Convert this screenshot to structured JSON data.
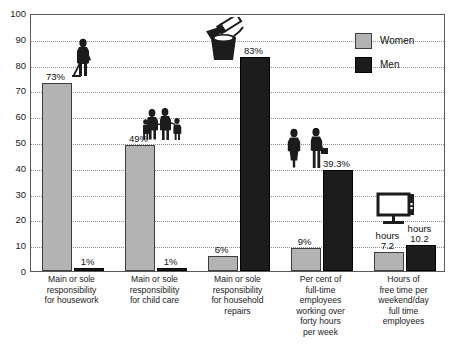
{
  "chart_data": {
    "type": "bar",
    "title": "",
    "subtitle": "",
    "xlabel": "",
    "ylabel": "",
    "ylim": [
      0,
      100
    ],
    "ytick_step": 10,
    "yticks": [
      "100",
      "90",
      "80",
      "70",
      "60",
      "50",
      "40",
      "30",
      "20",
      "10",
      "0"
    ],
    "grid": true,
    "legend_position": "top-right",
    "categories": [
      "Main or sole\nresponsibility\nfor housework",
      "Main or sole\nresponsibility\nfor child care",
      "Main or sole\nresponsibility\nfor household\nrepairs",
      "Per cent of\nfull-time\nemployees\nworking over\nforty hours\nper week",
      "Hours of\nfree time per\nweekend/day\nfull time\nemployees"
    ],
    "series": [
      {
        "name": "Women",
        "color": "#b3b3b3",
        "values": [
          73,
          49,
          6,
          9,
          7.2
        ],
        "labels": [
          "73%",
          "49%",
          "6%",
          "9%",
          "hours\n7.2"
        ]
      },
      {
        "name": "Men",
        "color": "#1c1c1c",
        "values": [
          1,
          1,
          83,
          39.3,
          10.2
        ],
        "labels": [
          "1%",
          "1%",
          "83%",
          "39.3%",
          "hours\n10.2"
        ]
      }
    ],
    "pictograms": [
      {
        "name": "person-sweeping-icon",
        "group": 0
      },
      {
        "name": "family-group-icon",
        "group": 1
      },
      {
        "name": "paint-bucket-brush-icon",
        "group": 2
      },
      {
        "name": "two-office-workers-icon",
        "group": 3
      },
      {
        "name": "television-monitor-icon",
        "group": 4
      }
    ]
  },
  "legend": {
    "items": [
      {
        "label": "Women",
        "swatch": "women"
      },
      {
        "label": "Men",
        "swatch": "men"
      }
    ]
  }
}
